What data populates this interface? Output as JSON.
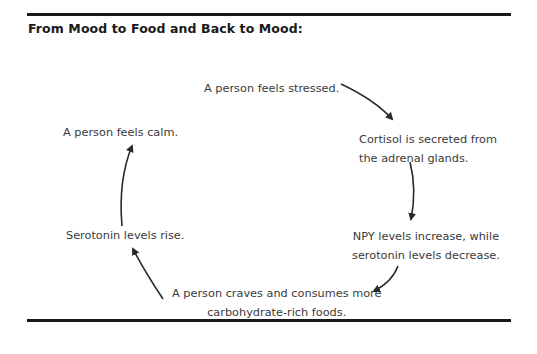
{
  "title": "From Mood to Food and Back to Mood:",
  "nodes": {
    "stressed": "A person feels stressed.",
    "cortisol_line1": "Cortisol is secreted from",
    "cortisol_line2": "the adrenal glands.",
    "npy_line1": "NPY levels increase, while",
    "npy_line2": "serotonin levels decrease.",
    "craves_line1": "A person craves and consumes more",
    "craves_line2": "carbohydrate-rich foods.",
    "serotonin_rise": "Serotonin levels rise.",
    "calm": "A person feels calm."
  },
  "colors": {
    "rule": "#1a1a1a",
    "text": "#3a3a3a",
    "arrow": "#2a2a2a"
  }
}
